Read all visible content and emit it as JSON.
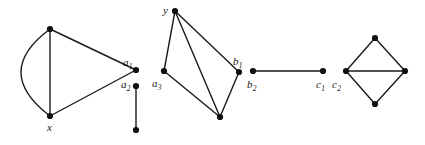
{
  "figure": {
    "type": "graph-diagram",
    "background_color": "#ffffff",
    "edge_color": "#1a1a1a",
    "vertex_color": "#101010",
    "vertex_radius": 3.1,
    "edge_width": 1.4,
    "width": 425,
    "height": 145
  },
  "labels": [
    {
      "id": "label-a1",
      "base": "a",
      "sub": "1",
      "x": 123,
      "y": 57
    },
    {
      "id": "label-a2",
      "base": "a",
      "sub": "2",
      "x": 121,
      "y": 79
    },
    {
      "id": "label-x",
      "base": "x",
      "sub": "",
      "x": 47,
      "y": 122
    },
    {
      "id": "label-y",
      "base": "y",
      "sub": "",
      "x": 163,
      "y": 5
    },
    {
      "id": "label-a3",
      "base": "a",
      "sub": "3",
      "x": 152,
      "y": 78
    },
    {
      "id": "label-b1",
      "base": "b",
      "sub": "1",
      "x": 233,
      "y": 56
    },
    {
      "id": "label-b2",
      "base": "b",
      "sub": "2",
      "x": 247,
      "y": 79
    },
    {
      "id": "label-c1",
      "base": "c",
      "sub": "1",
      "x": 316,
      "y": 79
    },
    {
      "id": "label-c2",
      "base": "c",
      "sub": "2",
      "x": 332,
      "y": 79
    }
  ],
  "components": [
    {
      "name": "component-1",
      "vertices": [
        {
          "id": "v-top-left",
          "x": 50,
          "y": 29
        },
        {
          "id": "v-x",
          "x": 50,
          "y": 116
        },
        {
          "id": "v-a1",
          "x": 136,
          "y": 70
        },
        {
          "id": "v-a2",
          "x": 136,
          "y": 86
        },
        {
          "id": "v-a2-leaf",
          "x": 136,
          "y": 130
        }
      ],
      "edges": [
        {
          "from": "v-top-left",
          "to": "v-x",
          "kind": "straight"
        },
        {
          "from": "v-top-left",
          "to": "v-x",
          "kind": "curved-left"
        },
        {
          "from": "v-top-left",
          "to": "v-a1",
          "kind": "straight"
        },
        {
          "from": "v-x",
          "to": "v-a1",
          "kind": "straight"
        },
        {
          "from": "v-a2",
          "to": "v-a2-leaf",
          "kind": "straight"
        }
      ]
    },
    {
      "name": "component-2",
      "vertices": [
        {
          "id": "v-y",
          "x": 175,
          "y": 11
        },
        {
          "id": "v-a3",
          "x": 164,
          "y": 71
        },
        {
          "id": "v-bottom",
          "x": 220,
          "y": 117
        },
        {
          "id": "v-b1",
          "x": 239,
          "y": 72
        }
      ],
      "edges": [
        {
          "from": "v-y",
          "to": "v-a3",
          "kind": "straight"
        },
        {
          "from": "v-y",
          "to": "v-bottom",
          "kind": "straight"
        },
        {
          "from": "v-y",
          "to": "v-b1",
          "kind": "straight"
        },
        {
          "from": "v-a3",
          "to": "v-bottom",
          "kind": "straight"
        },
        {
          "from": "v-bottom",
          "to": "v-b1",
          "kind": "straight"
        }
      ]
    },
    {
      "name": "component-3",
      "vertices": [
        {
          "id": "v-b2",
          "x": 253,
          "y": 71
        },
        {
          "id": "v-c1",
          "x": 323,
          "y": 71
        }
      ],
      "edges": [
        {
          "from": "v-b2",
          "to": "v-c1",
          "kind": "straight"
        }
      ]
    },
    {
      "name": "component-4",
      "vertices": [
        {
          "id": "v-c2",
          "x": 346,
          "y": 71
        },
        {
          "id": "v-diamond-top",
          "x": 375,
          "y": 38
        },
        {
          "id": "v-diamond-rt",
          "x": 405,
          "y": 71
        },
        {
          "id": "v-diamond-bot",
          "x": 375,
          "y": 104
        }
      ],
      "edges": [
        {
          "from": "v-c2",
          "to": "v-diamond-top",
          "kind": "straight"
        },
        {
          "from": "v-diamond-top",
          "to": "v-diamond-rt",
          "kind": "straight"
        },
        {
          "from": "v-c2",
          "to": "v-diamond-rt",
          "kind": "straight"
        },
        {
          "from": "v-c2",
          "to": "v-diamond-bot",
          "kind": "straight"
        },
        {
          "from": "v-diamond-bot",
          "to": "v-diamond-rt",
          "kind": "straight"
        }
      ]
    }
  ],
  "curves": [
    {
      "id": "curve-multi-edge",
      "from": "v-top-left",
      "to": "v-x",
      "control": {
        "x": -8,
        "y": 72
      }
    }
  ]
}
